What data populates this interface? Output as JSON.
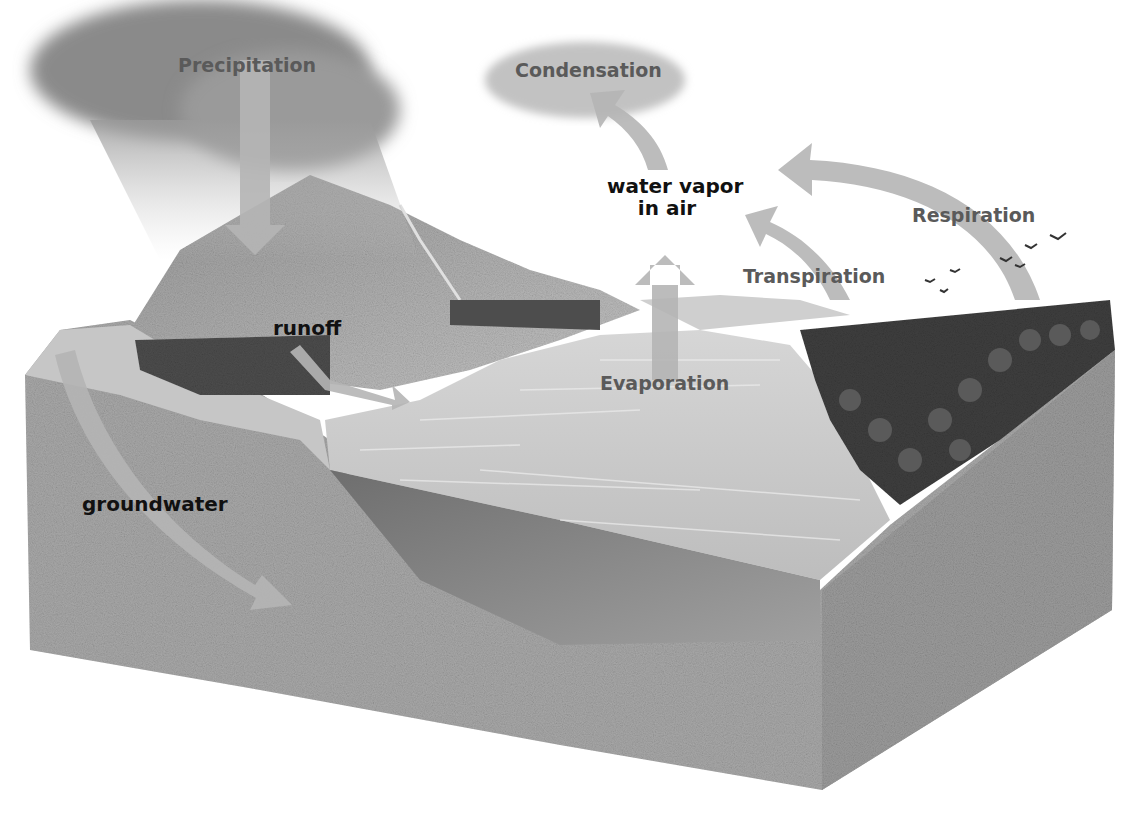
{
  "diagram": {
    "labels": {
      "precipitation": "Precipitation",
      "condensation": "Condensation",
      "water_vapor_line1": "water vapor",
      "water_vapor_line2": "in air",
      "respiration": "Respiration",
      "transpiration": "Transpiration",
      "evaporation": "Evaporation",
      "runoff": "runoff",
      "groundwater": "groundwater"
    },
    "colors": {
      "background": "#ffffff",
      "arrow": "#b5b5b5",
      "soil": "#a9a9a9",
      "water": "#c9c9c9",
      "forest": "#3f3f3f",
      "cloud": "#8a8a8a",
      "dark_label": "#111111",
      "gray_label": "#5a5a5a"
    }
  }
}
